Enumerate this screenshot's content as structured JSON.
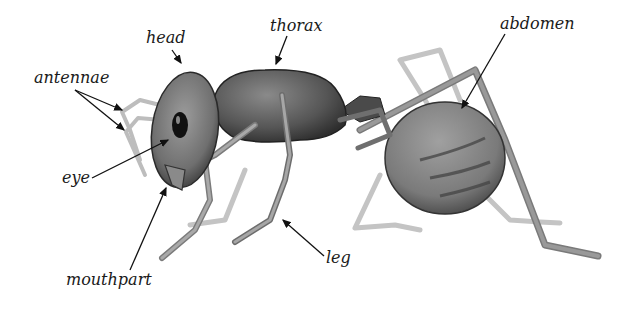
{
  "diagram": {
    "labels": {
      "head": "head",
      "thorax": "thorax",
      "abdomen": "abdomen",
      "antennae": "antennae",
      "eye": "eye",
      "mouthpart": "mouthpart",
      "leg": "leg"
    },
    "colors": {
      "background": "#ffffff",
      "body_dark": "#3a3a3a",
      "body_mid": "#6e6e6e",
      "body_light": "#9a9a9a",
      "limb_light": "#b8b8b8",
      "label_text": "#1a1a1a",
      "arrow": "#111111"
    }
  }
}
